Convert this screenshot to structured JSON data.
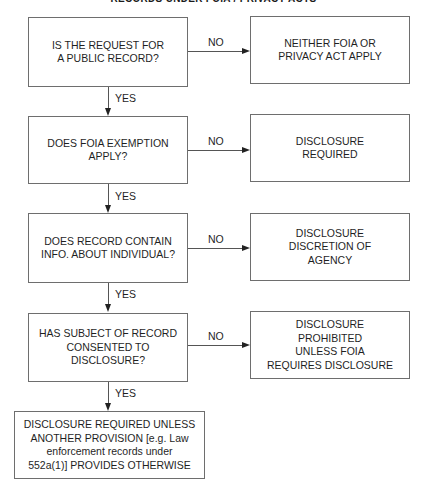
{
  "title": "RECORDS UNDER FOIA / PRIVACY ACTS",
  "decisions": [
    {
      "text": "IS THE REQUEST FOR\nA PUBLIC RECORD?",
      "no_label": "NO",
      "no_outcome": "NEITHER FOIA OR\nPRIVACY ACT APPLY",
      "yes_label": "YES"
    },
    {
      "text": "DOES FOIA EXEMPTION\nAPPLY?",
      "no_label": "NO",
      "no_outcome": "DISCLOSURE\nREQUIRED",
      "yes_label": "YES"
    },
    {
      "text": "DOES RECORD CONTAIN\nINFO. ABOUT INDIVIDUAL?",
      "no_label": "NO",
      "no_outcome": "DISCLOSURE\nDISCRETION OF\nAGENCY",
      "yes_label": "YES"
    },
    {
      "text": "HAS SUBJECT OF RECORD\nCONSENTED TO\nDISCLOSURE?",
      "no_label": "NO",
      "no_outcome": "DISCLOSURE\nPROHIBITED\nUNLESS FOIA\nREQUIRES DISCLOSURE",
      "yes_label": "YES"
    }
  ],
  "final_outcome": "DISCLOSURE REQUIRED UNLESS\nANOTHER PROVISION [e.g. Law\nenforcement records under\n552a(1)] PROVIDES OTHERWISE"
}
